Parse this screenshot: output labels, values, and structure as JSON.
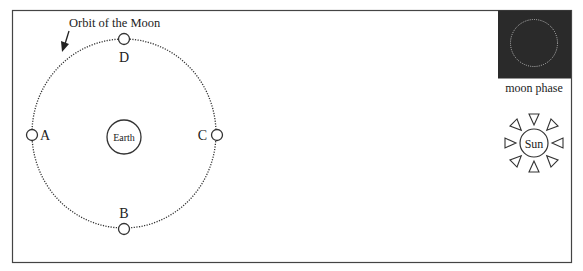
{
  "diagram": {
    "orbit_label": "Orbit of the Moon",
    "earth_label": "Earth",
    "sun_label": "Sun",
    "moon_phase_label": "moon phase",
    "positions": [
      {
        "id": "A",
        "label": "A"
      },
      {
        "id": "B",
        "label": "B"
      },
      {
        "id": "C",
        "label": "C"
      },
      {
        "id": "D",
        "label": "D"
      }
    ],
    "colors": {
      "frame": "#444444",
      "ink": "#222222",
      "moon_phase_bg": "#2a2a2a",
      "moon_phase_outline": "#bbbbbb"
    }
  }
}
